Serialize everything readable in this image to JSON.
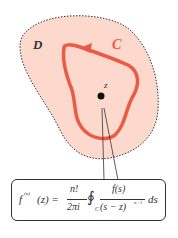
{
  "diagram": {
    "region_label": "D",
    "contour_label": "C",
    "point_label": "z",
    "colors": {
      "region_fill": "#fcd9cc",
      "region_border": "#333333",
      "contour": "#ec5a43",
      "point": "#111111",
      "text": "#333333"
    }
  },
  "formula": {
    "lhs": "f",
    "lhs_sup": "(n)",
    "lhs_arg": "(z) =",
    "num": "n!",
    "den": "2πi",
    "integral": "∮",
    "integral_sub": "C",
    "int_num": "f(s)",
    "int_den": "(s − z)",
    "int_den_sup": "n+1",
    "ds": "ds"
  }
}
